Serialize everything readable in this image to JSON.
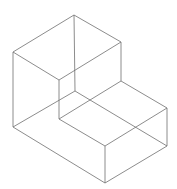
{
  "diagram": {
    "title": "",
    "stroke_color": "#6e6e6e",
    "background": "#ffffff",
    "vertices": {
      "A": [
        74,
        15
      ],
      "B": [
        13,
        52
      ],
      "C": [
        59,
        80
      ],
      "D": [
        121,
        42
      ],
      "E": [
        121,
        81
      ],
      "F": [
        59,
        119
      ],
      "G": [
        13,
        127
      ],
      "H": [
        105,
        183
      ],
      "I": [
        105,
        146
      ],
      "J": [
        167,
        108
      ],
      "K": [
        167,
        146
      ],
      "L": [
        75,
        91
      ]
    },
    "edges": [
      [
        "A",
        "B"
      ],
      [
        "A",
        "D"
      ],
      [
        "B",
        "C"
      ],
      [
        "C",
        "D"
      ],
      [
        "B",
        "G"
      ],
      [
        "C",
        "F"
      ],
      [
        "D",
        "E"
      ],
      [
        "A",
        "L"
      ],
      [
        "E",
        "J"
      ],
      [
        "F",
        "I"
      ],
      [
        "I",
        "J"
      ],
      [
        "G",
        "H"
      ],
      [
        "H",
        "I"
      ],
      [
        "H",
        "K"
      ],
      [
        "J",
        "K"
      ],
      [
        "G",
        "L"
      ],
      [
        "L",
        "K"
      ],
      [
        "E",
        "F"
      ]
    ]
  }
}
